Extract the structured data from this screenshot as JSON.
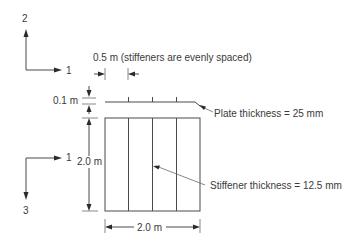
{
  "diagram": {
    "type": "stiffened-plate-schematic",
    "top_axes": {
      "vertical_label": "2",
      "horizontal_label": "1"
    },
    "side_axes": {
      "horizontal_label": "1",
      "vertical_label": "3"
    },
    "dimensions": {
      "stiffener_spacing": "0.5 m (stiffeners are evenly spaced)",
      "stiffener_height": "0.1 m",
      "plate_length": "2.0 m",
      "plate_width": "2.0 m"
    },
    "callouts": {
      "plate_thickness": "Plate thickness = 25 mm",
      "stiffener_thickness": "Stiffener thickness = 12.5 mm"
    },
    "stiffener_count": 3,
    "colors": {
      "line": "#4a4a4a",
      "text": "#3a3a3a",
      "background": "#ffffff"
    }
  }
}
